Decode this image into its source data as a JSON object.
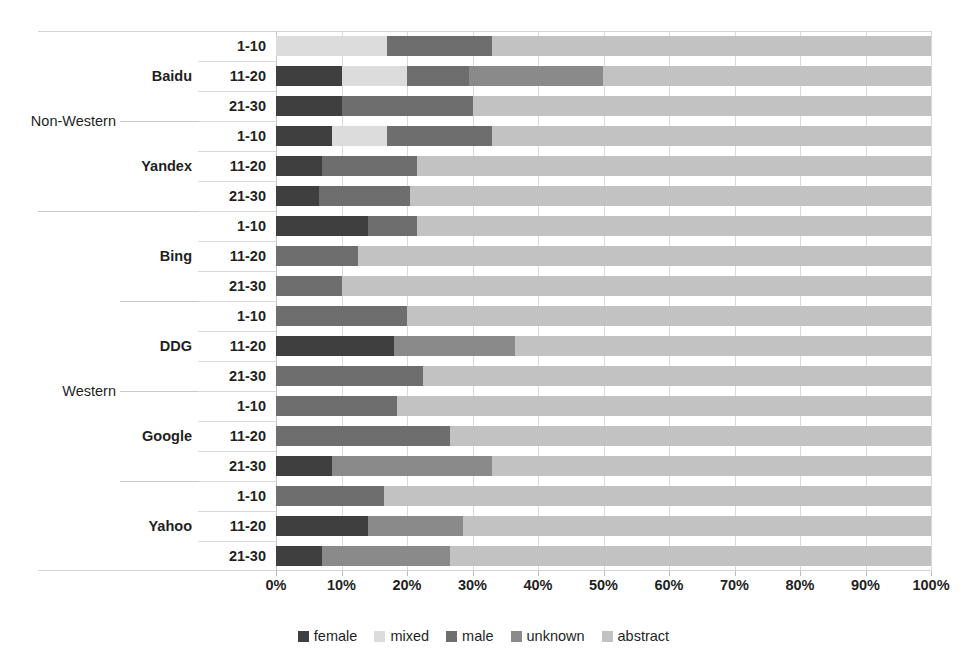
{
  "chart_data": {
    "type": "bar",
    "orientation": "horizontal",
    "stacked": true,
    "normalized": true,
    "title": "",
    "xlabel": "",
    "ylabel": "",
    "xlim": [
      0,
      100
    ],
    "xtick_labels": [
      "0%",
      "10%",
      "20%",
      "30%",
      "40%",
      "50%",
      "60%",
      "70%",
      "80%",
      "90%",
      "100%"
    ],
    "xtick_values": [
      0,
      10,
      20,
      30,
      40,
      50,
      60,
      70,
      80,
      90,
      100
    ],
    "grid": true,
    "legend_position": "bottom",
    "series": [
      {
        "name": "female",
        "color": "#3f3f3f"
      },
      {
        "name": "mixed",
        "color": "#dcdcdc"
      },
      {
        "name": "male",
        "color": "#6e6e6e"
      },
      {
        "name": "unknown",
        "color": "#8a8a8a"
      },
      {
        "name": "abstract",
        "color": "#c2c2c2"
      }
    ],
    "group_levels": [
      "region",
      "engine",
      "depth"
    ],
    "regions": [
      {
        "label": "Non-Western",
        "engines": [
          {
            "label": "Baidu",
            "rows": [
              {
                "depth": "1-10",
                "values": {
                  "female": 0.0,
                  "mixed": 17.0,
                  "male": 16.0,
                  "unknown": 0.0,
                  "abstract": 67.0
                }
              },
              {
                "depth": "11-20",
                "values": {
                  "female": 10.0,
                  "mixed": 10.0,
                  "male": 9.5,
                  "unknown": 20.5,
                  "abstract": 50.0
                }
              },
              {
                "depth": "21-30",
                "values": {
                  "female": 10.0,
                  "mixed": 0.0,
                  "male": 20.0,
                  "unknown": 0.0,
                  "abstract": 70.0
                }
              }
            ]
          },
          {
            "label": "Yandex",
            "rows": [
              {
                "depth": "1-10",
                "values": {
                  "female": 8.5,
                  "mixed": 8.5,
                  "male": 16.0,
                  "unknown": 0.0,
                  "abstract": 67.0
                }
              },
              {
                "depth": "11-20",
                "values": {
                  "female": 7.0,
                  "mixed": 0.0,
                  "male": 14.5,
                  "unknown": 0.0,
                  "abstract": 78.5
                }
              },
              {
                "depth": "21-30",
                "values": {
                  "female": 6.5,
                  "mixed": 0.0,
                  "male": 14.0,
                  "unknown": 0.0,
                  "abstract": 79.5
                }
              }
            ]
          }
        ]
      },
      {
        "label": "Western",
        "engines": [
          {
            "label": "Bing",
            "rows": [
              {
                "depth": "1-10",
                "values": {
                  "female": 14.0,
                  "mixed": 0.0,
                  "male": 7.5,
                  "unknown": 0.0,
                  "abstract": 78.5
                }
              },
              {
                "depth": "11-20",
                "values": {
                  "female": 0.0,
                  "mixed": 0.0,
                  "male": 12.5,
                  "unknown": 0.0,
                  "abstract": 87.5
                }
              },
              {
                "depth": "21-30",
                "values": {
                  "female": 0.0,
                  "mixed": 0.0,
                  "male": 10.0,
                  "unknown": 0.0,
                  "abstract": 90.0
                }
              }
            ]
          },
          {
            "label": "DDG",
            "rows": [
              {
                "depth": "1-10",
                "values": {
                  "female": 0.0,
                  "mixed": 0.0,
                  "male": 20.0,
                  "unknown": 0.0,
                  "abstract": 80.0
                }
              },
              {
                "depth": "11-20",
                "values": {
                  "female": 18.0,
                  "mixed": 0.0,
                  "male": 0.0,
                  "unknown": 18.5,
                  "abstract": 63.5
                }
              },
              {
                "depth": "21-30",
                "values": {
                  "female": 0.0,
                  "mixed": 0.0,
                  "male": 22.5,
                  "unknown": 0.0,
                  "abstract": 77.5
                }
              }
            ]
          },
          {
            "label": "Google",
            "rows": [
              {
                "depth": "1-10",
                "values": {
                  "female": 0.0,
                  "mixed": 0.0,
                  "male": 18.5,
                  "unknown": 0.0,
                  "abstract": 81.5
                }
              },
              {
                "depth": "11-20",
                "values": {
                  "female": 0.0,
                  "mixed": 0.0,
                  "male": 26.5,
                  "unknown": 0.0,
                  "abstract": 73.5
                }
              },
              {
                "depth": "21-30",
                "values": {
                  "female": 8.5,
                  "mixed": 0.0,
                  "male": 0.0,
                  "unknown": 24.5,
                  "abstract": 67.0
                }
              }
            ]
          },
          {
            "label": "Yahoo",
            "rows": [
              {
                "depth": "1-10",
                "values": {
                  "female": 0.0,
                  "mixed": 0.0,
                  "male": 16.5,
                  "unknown": 0.0,
                  "abstract": 83.5
                }
              },
              {
                "depth": "11-20",
                "values": {
                  "female": 14.0,
                  "mixed": 0.0,
                  "male": 0.0,
                  "unknown": 14.5,
                  "abstract": 71.5
                }
              },
              {
                "depth": "21-30",
                "values": {
                  "female": 7.0,
                  "mixed": 0.0,
                  "male": 0.0,
                  "unknown": 19.5,
                  "abstract": 73.5
                }
              }
            ]
          }
        ]
      }
    ]
  }
}
